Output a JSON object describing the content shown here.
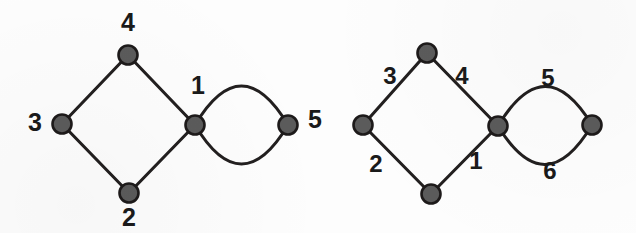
{
  "figure": {
    "type": "graph-diagram",
    "background_color": "#fdfdfd",
    "node_fill_color": "#5b5b5b",
    "node_stroke_color": "#1d1a1a",
    "edge_color": "#221f1f",
    "label_color": "#1a1a1a"
  },
  "graphs": [
    {
      "id": "left-graph",
      "name": "vertex-labeled-graph",
      "label_kind": "vertex",
      "nodes": [
        {
          "id": "L4",
          "label": "4",
          "cx": 128,
          "cy": 55,
          "r": 9.5,
          "label_x": 128,
          "label_y": 24
        },
        {
          "id": "L3",
          "label": "3",
          "cx": 62,
          "cy": 124,
          "r": 9.5,
          "label_x": 35,
          "label_y": 124
        },
        {
          "id": "L1",
          "label": "1",
          "cx": 195,
          "cy": 125,
          "r": 9.5,
          "label_x": 198,
          "label_y": 87
        },
        {
          "id": "L2",
          "label": "2",
          "cx": 129,
          "cy": 193,
          "r": 9.5,
          "label_x": 129,
          "label_y": 219
        },
        {
          "id": "L5",
          "label": "5",
          "cx": 288,
          "cy": 125,
          "r": 9.5,
          "label_x": 315,
          "label_y": 121
        }
      ],
      "edges": [
        {
          "id": "L-e1",
          "from": "L3",
          "to": "L4",
          "kind": "straight",
          "label": ""
        },
        {
          "id": "L-e2",
          "from": "L4",
          "to": "L1",
          "kind": "straight",
          "label": ""
        },
        {
          "id": "L-e3",
          "from": "L3",
          "to": "L2",
          "kind": "straight",
          "label": ""
        },
        {
          "id": "L-e4",
          "from": "L2",
          "to": "L1",
          "kind": "straight",
          "label": ""
        },
        {
          "id": "L-e5",
          "from": "L1",
          "to": "L5",
          "kind": "arc-up",
          "label": ""
        },
        {
          "id": "L-e6",
          "from": "L1",
          "to": "L5",
          "kind": "arc-down",
          "label": ""
        }
      ]
    },
    {
      "id": "right-graph",
      "name": "edge-labeled-graph",
      "label_kind": "edge",
      "nodes": [
        {
          "id": "R-top",
          "label": "",
          "cx": 427,
          "cy": 53,
          "r": 9.5
        },
        {
          "id": "R-left",
          "label": "",
          "cx": 363,
          "cy": 125,
          "r": 9.5
        },
        {
          "id": "R-center",
          "label": "",
          "cx": 498,
          "cy": 126,
          "r": 9.5
        },
        {
          "id": "R-bottom",
          "label": "",
          "cx": 431,
          "cy": 194,
          "r": 9.5
        },
        {
          "id": "R-right",
          "label": "",
          "cx": 592,
          "cy": 125,
          "r": 9.5
        }
      ],
      "edges": [
        {
          "id": "R-e3",
          "from": "R-left",
          "to": "R-top",
          "kind": "straight",
          "label": "3",
          "label_x": 390,
          "label_y": 78
        },
        {
          "id": "R-e4",
          "from": "R-top",
          "to": "R-center",
          "kind": "straight",
          "label": "4",
          "label_x": 462,
          "label_y": 78
        },
        {
          "id": "R-e2",
          "from": "R-left",
          "to": "R-bottom",
          "kind": "straight",
          "label": "2",
          "label_x": 376,
          "label_y": 166
        },
        {
          "id": "R-e1",
          "from": "R-bottom",
          "to": "R-center",
          "kind": "straight",
          "label": "1",
          "label_x": 476,
          "label_y": 163
        },
        {
          "id": "R-e5",
          "from": "R-center",
          "to": "R-right",
          "kind": "arc-up",
          "label": "5",
          "label_x": 548,
          "label_y": 80
        },
        {
          "id": "R-e6",
          "from": "R-center",
          "to": "R-right",
          "kind": "arc-down",
          "label": "6",
          "label_x": 550,
          "label_y": 173
        }
      ]
    }
  ]
}
